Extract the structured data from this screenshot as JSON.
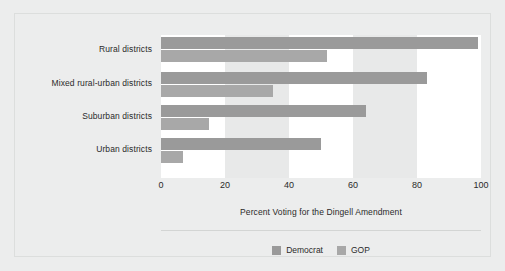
{
  "chart_data": {
    "type": "bar",
    "orientation": "horizontal",
    "title": "",
    "xlabel": "Percent Voting for the Dingell Amendment",
    "ylabel": "",
    "xlim": [
      0,
      100
    ],
    "xticks": [
      0,
      20,
      40,
      60,
      80,
      100
    ],
    "xtick_labels": [
      "0",
      "20",
      "40",
      "60",
      "80",
      "100"
    ],
    "grid": false,
    "bands": true,
    "legend_position": "bottom",
    "categories": [
      "Rural districts",
      "Mixed rural-urban districts",
      "Suburban districts",
      "Urban districts"
    ],
    "series": [
      {
        "name": "Democrat",
        "color": "#9a9a9a",
        "values": [
          99,
          83,
          64,
          50
        ]
      },
      {
        "name": "GOP",
        "color": "#a8a8a8",
        "values": [
          52,
          35,
          15,
          7
        ]
      }
    ]
  },
  "legend": {
    "items": [
      {
        "label": "Democrat",
        "color": "#9a9a9a"
      },
      {
        "label": "GOP",
        "color": "#a8a8a8"
      }
    ]
  },
  "colors": {
    "background": "#eceded",
    "band_white": "#ffffff",
    "band_gray": "#e8e9e9",
    "text": "#2a2a2a",
    "frame": "#dcdedd",
    "separator": "#d3d5d4"
  }
}
